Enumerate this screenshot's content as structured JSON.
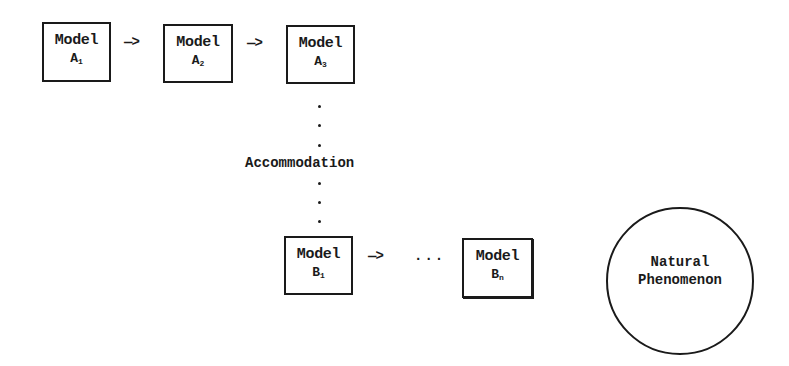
{
  "diagram": {
    "models_a": [
      {
        "title": "Model",
        "letter": "A",
        "sub": "1"
      },
      {
        "title": "Model",
        "letter": "A",
        "sub": "2"
      },
      {
        "title": "Model",
        "letter": "A",
        "sub": "3"
      }
    ],
    "models_b": [
      {
        "title": "Model",
        "letter": "B",
        "sub": "1"
      },
      {
        "title": "Model",
        "letter": "B",
        "sub": "n"
      }
    ],
    "arrow": "—>",
    "ellipsis": "...",
    "transition_label": "Accommodation",
    "phenomenon": {
      "line1": "Natural",
      "line2": "Phenomenon"
    }
  }
}
